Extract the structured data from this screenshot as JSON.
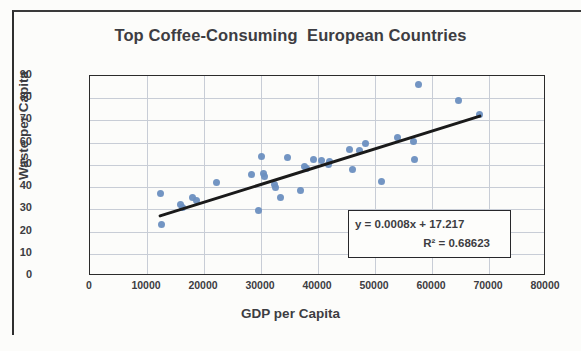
{
  "chart_data": {
    "type": "scatter",
    "title": "Top Coffee-Consuming  European Countries",
    "xlabel": "GDP per Capita",
    "ylabel": "Waste per Capita",
    "xlim": [
      0,
      80000
    ],
    "ylim": [
      0,
      90
    ],
    "xticks": [
      "0",
      "10000",
      "20000",
      "30000",
      "40000",
      "50000",
      "60000",
      "70000",
      "80000"
    ],
    "yticks": [
      "0",
      "10",
      "20",
      "30",
      "40",
      "50",
      "60",
      "70",
      "80",
      "90"
    ],
    "grid": "both",
    "legend": "none",
    "marker_color": "#6b8fc0",
    "trendline_color": "#1a1a1a",
    "points": [
      {
        "x": 12400,
        "y": 37.0
      },
      {
        "x": 12600,
        "y": 23.0
      },
      {
        "x": 15900,
        "y": 32.0
      },
      {
        "x": 16300,
        "y": 31.0
      },
      {
        "x": 18000,
        "y": 35.5
      },
      {
        "x": 18600,
        "y": 34.0
      },
      {
        "x": 22200,
        "y": 42.0
      },
      {
        "x": 28300,
        "y": 45.5
      },
      {
        "x": 29500,
        "y": 29.5
      },
      {
        "x": 30100,
        "y": 54.0
      },
      {
        "x": 30400,
        "y": 46.0
      },
      {
        "x": 30600,
        "y": 45.0
      },
      {
        "x": 32300,
        "y": 41.0
      },
      {
        "x": 32600,
        "y": 40.0
      },
      {
        "x": 33400,
        "y": 35.5
      },
      {
        "x": 34700,
        "y": 53.5
      },
      {
        "x": 36900,
        "y": 38.5
      },
      {
        "x": 37600,
        "y": 49.5
      },
      {
        "x": 38000,
        "y": 48.5
      },
      {
        "x": 39200,
        "y": 52.5
      },
      {
        "x": 40600,
        "y": 52.0
      },
      {
        "x": 41800,
        "y": 50.0
      },
      {
        "x": 42000,
        "y": 51.5
      },
      {
        "x": 45600,
        "y": 57.0
      },
      {
        "x": 46000,
        "y": 48.0
      },
      {
        "x": 47200,
        "y": 56.5
      },
      {
        "x": 48300,
        "y": 59.5
      },
      {
        "x": 51200,
        "y": 42.5
      },
      {
        "x": 54000,
        "y": 62.5
      },
      {
        "x": 56800,
        "y": 60.5
      },
      {
        "x": 57000,
        "y": 52.5
      },
      {
        "x": 57600,
        "y": 86.0
      },
      {
        "x": 64700,
        "y": 79.0
      },
      {
        "x": 68300,
        "y": 72.5
      }
    ],
    "trendline": {
      "slope": 0.0008,
      "intercept": 17.217,
      "x_start": 12300,
      "x_end": 68400,
      "equation": "y = 0.0008x + 17.217",
      "r_squared_label": "R² = 0.68623",
      "r_squared": 0.68623
    }
  }
}
